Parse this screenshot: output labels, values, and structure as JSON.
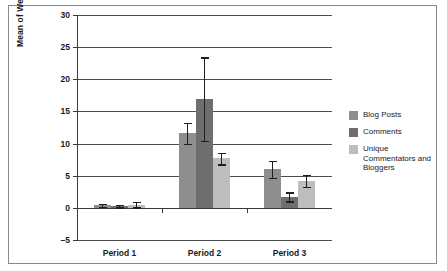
{
  "chart_data": {
    "type": "bar",
    "title": "",
    "xlabel": "",
    "ylabel": "Mean of Weekly Instances",
    "categories": [
      "Period 1",
      "Period 2",
      "Period 3"
    ],
    "ylim": [
      -5,
      30
    ],
    "yticks": [
      -5,
      0,
      5,
      10,
      15,
      20,
      25,
      30
    ],
    "ytick_labels": [
      "–5",
      "0",
      "5",
      "10",
      "15",
      "20",
      "25",
      "30"
    ],
    "grid": true,
    "legend_position": "right",
    "series": [
      {
        "name": "Blog Posts",
        "color": "#8e8e8e",
        "values": [
          0.4,
          11.6,
          6.0
        ],
        "errors": [
          0.2,
          1.6,
          1.3
        ]
      },
      {
        "name": "Comments",
        "color": "#6e6e6e",
        "values": [
          0.3,
          16.9,
          1.7
        ],
        "errors": [
          0.2,
          6.5,
          0.7
        ]
      },
      {
        "name": "Unique Commentators and Bloggers",
        "color": "#bdbdbd",
        "values": [
          0.5,
          7.7,
          4.2
        ],
        "errors": [
          0.4,
          0.9,
          0.9
        ]
      }
    ]
  },
  "legend": {
    "items": [
      {
        "label": "Blog Posts",
        "color": "#8e8e8e"
      },
      {
        "label": "Comments",
        "color": "#6e6e6e"
      },
      {
        "label": "Unique Commentators and Bloggers",
        "color": "#bdbdbd"
      }
    ]
  },
  "axis": {
    "y_title": "Mean of Weekly Instances"
  }
}
